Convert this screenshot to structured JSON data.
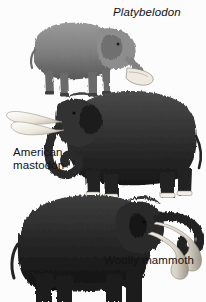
{
  "figure": {
    "background_color": "#fcfcfc",
    "style": "grayscale scientific illustration",
    "width": 206,
    "height": 302,
    "specimens": [
      {
        "id": "platybelodon",
        "label": "Platybelodon",
        "label_style": "italic",
        "position": "top",
        "facing": "right",
        "body_color": "#8a8a8a",
        "shade_color": "#5e5e5e",
        "distinguishing_feature": "broad shovel-shaped lower jaw with flattened tusks",
        "tusk_color": "#efeae0"
      },
      {
        "id": "american-mastodon",
        "label": "American\nmastodon",
        "label_style": "normal",
        "position": "middle",
        "facing": "left",
        "body_color": "#3a3a3a",
        "shade_color": "#1c1c1c",
        "distinguishing_feature": "long upward-curving tusks and curled trunk",
        "tusk_color": "#f2efe8"
      },
      {
        "id": "woolly-mammoth",
        "label": "Woolly mammoth",
        "label_style": "normal",
        "position": "bottom",
        "facing": "right",
        "body_color": "#2e2e2e",
        "shade_color": "#141414",
        "distinguishing_feature": "shaggy long fur, domed head, very long spiral tusks",
        "tusk_color": "#e9e5dc"
      }
    ]
  }
}
